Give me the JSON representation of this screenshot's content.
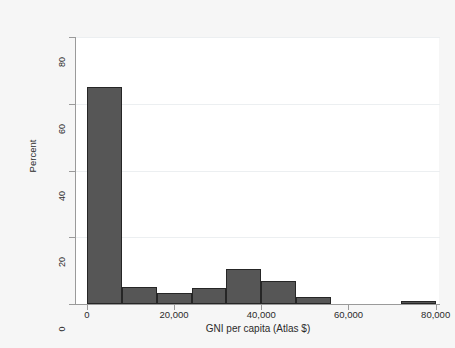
{
  "figure": {
    "background_color": "#f6f6f6",
    "plot_background_color": "#ffffff",
    "axis_color": "#9a9a9a",
    "bar_fill_color": "#565656",
    "bar_outline_color": "#262626"
  },
  "chart_data": {
    "type": "bar",
    "subtype": "histogram",
    "title": "",
    "subtitle": "",
    "xlabel": "GNI per capita (Atlas $)",
    "ylabel": "Percent",
    "xlim": [
      -2500,
      81000
    ],
    "ylim": [
      0,
      80
    ],
    "xticks": [
      0,
      20000,
      40000,
      60000,
      80000
    ],
    "xtick_labels": [
      "0",
      "20,000",
      "40,000",
      "60,000",
      "80,000"
    ],
    "yticks": [
      0,
      20,
      40,
      60,
      80
    ],
    "ytick_labels": [
      "0",
      "20",
      "40",
      "60",
      "80"
    ],
    "grid": "horizontal",
    "legend": "none",
    "bin_width": 8000,
    "bin_edges": [
      0,
      8000,
      16000,
      24000,
      32000,
      40000,
      48000,
      56000,
      64000,
      72000,
      80000
    ],
    "categories": [
      "0–8,000",
      "8,000–16,000",
      "16,000–24,000",
      "24,000–32,000",
      "32,000–40,000",
      "40,000–48,000",
      "48,000–56,000",
      "56,000–64,000",
      "64,000–72,000",
      "72,000–80,000"
    ],
    "values": [
      65,
      5,
      3.4,
      4.8,
      10.5,
      6.8,
      2,
      0,
      0,
      1
    ],
    "annotations": []
  }
}
